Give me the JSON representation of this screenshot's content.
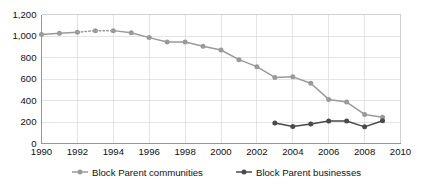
{
  "chart_data": {
    "type": "line",
    "title": "",
    "subtitle": "",
    "xlabel": "",
    "ylabel": "",
    "xlim": [
      1990,
      2010
    ],
    "ylim": [
      0,
      1200
    ],
    "grid": true,
    "legend_position": "bottom",
    "x_tick_labels": [
      "1990",
      "1992",
      "1994",
      "1996",
      "1998",
      "2000",
      "2002",
      "2004",
      "2006",
      "2008",
      "2010"
    ],
    "x_ticks": [
      1990,
      1992,
      1994,
      1996,
      1998,
      2000,
      2002,
      2004,
      2006,
      2008,
      2010
    ],
    "y_tick_labels": [
      "0",
      "200",
      "400",
      "600",
      "800",
      "1,000",
      "1,200"
    ],
    "y_ticks": [
      0,
      200,
      400,
      600,
      800,
      1000,
      1200
    ],
    "series": [
      {
        "name": "Block Parent communities",
        "color": "#9a9a9a",
        "x": [
          1990,
          1991,
          1992,
          1993,
          1994,
          1995,
          1996,
          1997,
          1998,
          1999,
          2000,
          2001,
          2002,
          2003,
          2004,
          2005,
          2006,
          2007,
          2008,
          2009
        ],
        "values": [
          1015,
          1025,
          1035,
          1050,
          1050,
          1030,
          985,
          945,
          945,
          905,
          870,
          780,
          715,
          615,
          620,
          560,
          410,
          385,
          270,
          245
        ],
        "dotted_segments": [
          [
            1992,
            1993
          ],
          [
            1993,
            1994
          ]
        ]
      },
      {
        "name": "Block Parent businesses",
        "color": "#4a4a4a",
        "x": [
          2003,
          2004,
          2005,
          2006,
          2007,
          2008,
          2009
        ],
        "values": [
          190,
          158,
          182,
          210,
          210,
          155,
          212
        ],
        "dotted_segments": []
      }
    ]
  },
  "legend": {
    "items": [
      {
        "label": "Block Parent communities",
        "color": "#9a9a9a"
      },
      {
        "label": "Block Parent businesses",
        "color": "#4a4a4a"
      }
    ]
  }
}
